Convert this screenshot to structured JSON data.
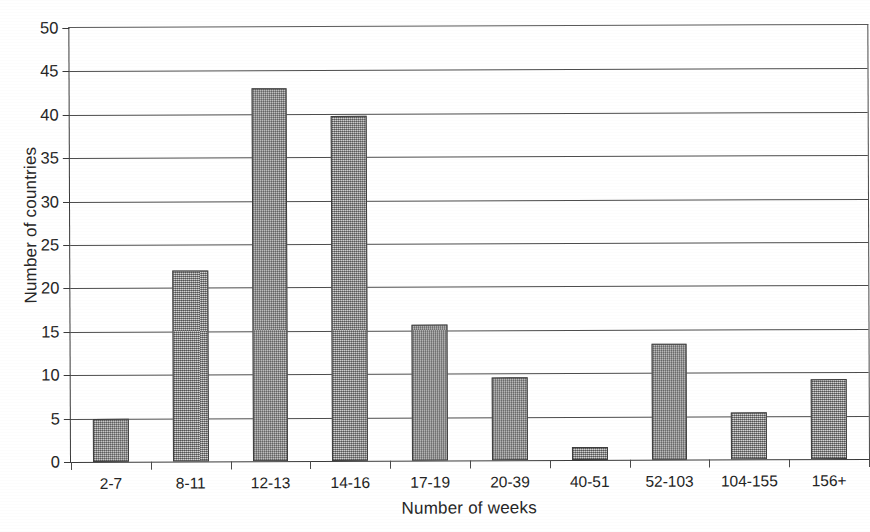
{
  "chart_data": {
    "type": "bar",
    "title": "",
    "xlabel": "Number of weeks",
    "ylabel": "Number of countries",
    "categories": [
      "2-7",
      "8-11",
      "12-13",
      "14-16",
      "17-19",
      "20-39",
      "40-51",
      "52-103",
      "104-155",
      "156+"
    ],
    "values": [
      5,
      22,
      43,
      39.8,
      15.7,
      9.6,
      1.5,
      13.4,
      5.4,
      9.2
    ],
    "ylim": [
      0,
      50
    ],
    "ytick_values": [
      0,
      5,
      10,
      15,
      20,
      25,
      30,
      35,
      40,
      45,
      50
    ],
    "ytick_labels": [
      "0",
      "5",
      "10",
      "15",
      "20",
      "25",
      "30",
      "35",
      "40",
      "45",
      "50"
    ],
    "grid": "horizontal",
    "legend": "none",
    "bar_color": "#9a9a9a",
    "bar_edge_color": "#3d3d3d",
    "axis_color": "#3a3a3a",
    "grid_color": "#4d4d4d",
    "background_color": "#ffffff"
  }
}
